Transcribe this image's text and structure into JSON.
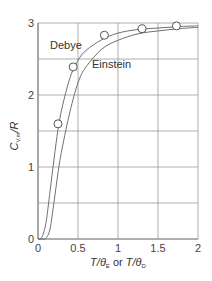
{
  "chart_data": {
    "type": "line",
    "title": "",
    "xlabel": "T/θE or T/θD",
    "ylabel": "CV,m/R",
    "xlim": [
      0,
      2
    ],
    "ylim": [
      0,
      3
    ],
    "grid": true,
    "x_ticks": [
      "0",
      "0.5",
      "1",
      "1.5",
      "2"
    ],
    "y_ticks": [
      "0",
      "1",
      "2",
      "3"
    ],
    "series": [
      {
        "name": "Debye",
        "x": [
          0,
          0.05,
          0.1,
          0.15,
          0.2,
          0.25,
          0.3,
          0.4,
          0.5,
          0.6,
          0.8,
          1.0,
          1.25,
          1.5,
          1.75,
          2.0
        ],
        "y": [
          0,
          0.03,
          0.23,
          0.66,
          1.11,
          1.52,
          1.82,
          2.24,
          2.48,
          2.62,
          2.77,
          2.86,
          2.91,
          2.93,
          2.95,
          2.96
        ]
      },
      {
        "name": "Einstein",
        "x": [
          0,
          0.05,
          0.1,
          0.15,
          0.2,
          0.25,
          0.3,
          0.4,
          0.5,
          0.6,
          0.8,
          1.0,
          1.25,
          1.5,
          1.75,
          2.0
        ],
        "y": [
          0,
          0.0,
          0.01,
          0.14,
          0.51,
          0.92,
          1.25,
          1.77,
          2.17,
          2.39,
          2.64,
          2.76,
          2.85,
          2.89,
          2.92,
          2.94
        ]
      },
      {
        "name": "Experimental points",
        "marker": "open-circle",
        "x": [
          0.25,
          0.44,
          0.83,
          1.3,
          1.73
        ],
        "y": [
          1.6,
          2.39,
          2.83,
          2.92,
          2.96
        ]
      }
    ],
    "annotations": [
      {
        "text": "Debye",
        "x": 0.15,
        "y": 2.7
      },
      {
        "text": "Einstein",
        "x": 0.68,
        "y": 2.43
      }
    ]
  },
  "labels": {
    "debye": "Debye",
    "einstein": "Einstein",
    "ylabel_main": "C",
    "ylabel_sub": "V,m",
    "ylabel_tail": "/R",
    "xlabel_t1": "T/θ",
    "xlabel_sub1": "E",
    "xlabel_or": " or ",
    "xlabel_t2": "T/θ",
    "xlabel_sub2": "D"
  },
  "colors": {
    "grid": "#9a9a9a",
    "curve": "#707070",
    "axis": "#888888"
  }
}
